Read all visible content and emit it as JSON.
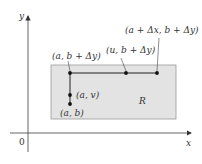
{
  "diagram": {
    "axes": {
      "x_label": "x",
      "y_label": "y",
      "origin_label": "0"
    },
    "region": {
      "label": "R",
      "fill": "#e3e3e3",
      "stroke": "#999999"
    },
    "points": [
      {
        "id": "a-b",
        "label": "(a, b)"
      },
      {
        "id": "a-v",
        "label": "(a, v)"
      },
      {
        "id": "a-bdy",
        "label": "(a, b + Δy)"
      },
      {
        "id": "u-bdy",
        "label": "(u, b + Δy)"
      },
      {
        "id": "adx-bdy",
        "label": "(a + Δx, b + Δy)"
      }
    ]
  }
}
